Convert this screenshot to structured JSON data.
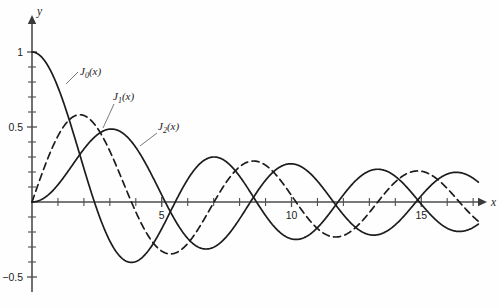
{
  "figure": {
    "title": "",
    "background_color": "#fefefe",
    "curve_color": "#1c1c1c",
    "axis_color": "#4d4d4d"
  },
  "axes": {
    "x_axis_name": "x",
    "y_axis_name": "y",
    "origin_px": {
      "x": 32,
      "y": 202
    },
    "px_per_x_unit": 25.95,
    "px_per_y_unit": 150,
    "x_tick_labels": [
      {
        "value": 5,
        "text": "5"
      },
      {
        "value": 10,
        "text": "10"
      },
      {
        "value": 15,
        "text": "15"
      }
    ],
    "y_tick_labels": [
      {
        "value": 1,
        "text": "1"
      },
      {
        "value": 0.5,
        "text": "0.5"
      },
      {
        "value": -0.5,
        "text": "−0.5"
      }
    ]
  },
  "curve_labels": [
    {
      "id": "J0",
      "text": "J",
      "sub": "0",
      "suffix": "(x)",
      "x_px": 80,
      "y_px": 75,
      "leader": {
        "x1": 78,
        "y1": 72,
        "x2": 66,
        "y2": 84
      }
    },
    {
      "id": "J1",
      "text": "J",
      "sub": "1",
      "suffix": "(x)",
      "x_px": 113,
      "y_px": 100,
      "leader": {
        "x1": 114,
        "y1": 104,
        "x2": 103,
        "y2": 128
      }
    },
    {
      "id": "J2",
      "text": "J",
      "sub": "2",
      "suffix": "(x)",
      "x_px": 158,
      "y_px": 130,
      "leader": {
        "x1": 157,
        "y1": 133,
        "x2": 140,
        "y2": 146
      }
    }
  ],
  "chart_data": {
    "type": "line",
    "title": "",
    "xlabel": "x",
    "ylabel": "y",
    "xlim": [
      0,
      17.2
    ],
    "ylim": [
      -0.55,
      1.05
    ],
    "grid": false,
    "legend_position": "inline-annotations",
    "x_ticks_major": [
      5,
      10,
      15
    ],
    "x_ticks_minor_step": 1,
    "y_ticks_major": [
      1,
      0.5,
      -0.5
    ],
    "y_ticks_minor_step": 0.1,
    "series": [
      {
        "name": "J0(x)",
        "style": "solid",
        "order": 0,
        "description": "Bessel function of the first kind, order 0",
        "key_points": [
          {
            "x": 0,
            "y": 1.0
          },
          {
            "x": 2.405,
            "y": 0.0
          },
          {
            "x": 3.83,
            "y": -0.403
          },
          {
            "x": 5.52,
            "y": 0.0
          },
          {
            "x": 7.02,
            "y": 0.3
          },
          {
            "x": 8.654,
            "y": 0.0
          },
          {
            "x": 10.17,
            "y": -0.25
          },
          {
            "x": 11.79,
            "y": 0.0
          },
          {
            "x": 13.32,
            "y": 0.218
          },
          {
            "x": 14.93,
            "y": 0.0
          },
          {
            "x": 16.47,
            "y": -0.197
          }
        ]
      },
      {
        "name": "J1(x)",
        "style": "dashed",
        "order": 1,
        "description": "Bessel function of the first kind, order 1",
        "key_points": [
          {
            "x": 0,
            "y": 0.0
          },
          {
            "x": 1.841,
            "y": 0.5819
          },
          {
            "x": 3.832,
            "y": 0.0
          },
          {
            "x": 5.33,
            "y": -0.3461
          },
          {
            "x": 7.016,
            "y": 0.0
          },
          {
            "x": 8.54,
            "y": 0.2733
          },
          {
            "x": 10.17,
            "y": 0.0
          },
          {
            "x": 11.71,
            "y": -0.2333
          },
          {
            "x": 13.32,
            "y": 0.0
          },
          {
            "x": 14.86,
            "y": 0.2065
          },
          {
            "x": 16.47,
            "y": 0.0
          }
        ]
      },
      {
        "name": "J2(x)",
        "style": "solid",
        "order": 2,
        "description": "Bessel function of the first kind, order 2",
        "key_points": [
          {
            "x": 0,
            "y": 0.0
          },
          {
            "x": 3.054,
            "y": 0.4865
          },
          {
            "x": 5.136,
            "y": 0.0
          },
          {
            "x": 6.706,
            "y": -0.3135
          },
          {
            "x": 8.417,
            "y": 0.0
          },
          {
            "x": 9.97,
            "y": 0.2547
          },
          {
            "x": 11.62,
            "y": 0.0
          },
          {
            "x": 13.17,
            "y": -0.2204
          },
          {
            "x": 14.8,
            "y": 0.0
          },
          {
            "x": 16.35,
            "y": 0.1972
          }
        ]
      }
    ]
  }
}
